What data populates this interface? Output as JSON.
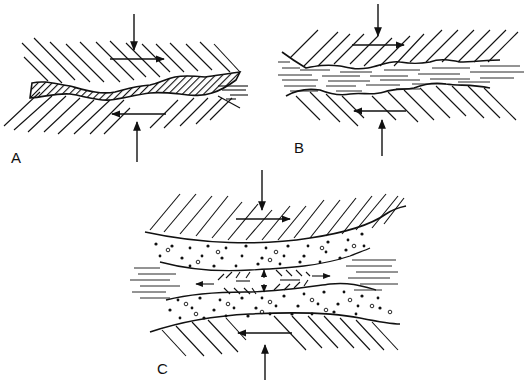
{
  "figure": {
    "panels": [
      {
        "id": "A",
        "label": "A",
        "description": "Two hatched solid surfaces separated by a thin wavy cross-hatched film; normal load arrows top and bottom, opposing shear arrows"
      },
      {
        "id": "B",
        "label": "B",
        "description": "Two hatched solid surfaces with wavy boundaries separated by a dashed fluid-like layer; normal load and opposing shear arrows"
      },
      {
        "id": "C",
        "label": "C",
        "description": "Curved hatched surfaces enclosing a dotted particle layer with a central lens of small oriented arrows and a dashed fluid band; normal load and opposing shear arrows"
      }
    ],
    "colors": {
      "ink": "#111111",
      "background": "#ffffff"
    }
  }
}
